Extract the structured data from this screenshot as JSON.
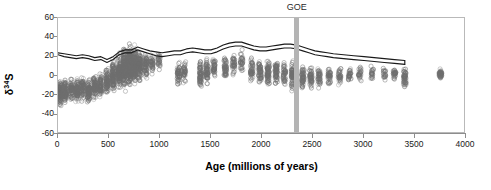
{
  "chart_data": {
    "type": "scatter",
    "title": "",
    "xlabel": "Age (millions of years)",
    "ylabel_text": "δ",
    "ylabel_sup": "34",
    "ylabel_tail": "S",
    "xlim": [
      0,
      4000
    ],
    "ylim": [
      -60,
      60
    ],
    "xticks": [
      0,
      500,
      1000,
      1500,
      2000,
      2500,
      3000,
      3500,
      4000
    ],
    "yticks": [
      60,
      40,
      20,
      0,
      -20,
      -40,
      -60
    ],
    "grid": false,
    "legend": "none",
    "annotations": [
      {
        "label": "GOE",
        "x": 2350,
        "type": "vertical-band",
        "color": "#b4b4b4",
        "width_myr": 50
      }
    ],
    "marker": {
      "shape": "open-circle",
      "color": "#6e6e6e",
      "size": 2.1
    },
    "series": [
      {
        "name": "sulfate δ34S trend upper",
        "type": "line",
        "color": "#1a1a1a",
        "x": [
          0,
          60,
          120,
          180,
          240,
          300,
          360,
          420,
          480,
          540,
          600,
          660,
          720,
          780,
          840,
          900,
          960,
          1020,
          1080,
          1140,
          1200,
          1260,
          1320,
          1380,
          1440,
          1500,
          1560,
          1620,
          1680,
          1740,
          1800,
          1860,
          1920,
          1980,
          2040,
          2100,
          2160,
          2220,
          2280,
          2340,
          2400,
          2460,
          2520,
          2580,
          2640,
          2700,
          2800,
          2900,
          3000,
          3100,
          3200,
          3300,
          3400
        ],
        "y": [
          24,
          23,
          22,
          21,
          22,
          21,
          19,
          20,
          17,
          20,
          25,
          27,
          27,
          30,
          28,
          26,
          25,
          24,
          25,
          26,
          26,
          28,
          29,
          28,
          27,
          27,
          29,
          32,
          34,
          35,
          35,
          33,
          31,
          30,
          30,
          31,
          32,
          33,
          33,
          32,
          30,
          28,
          26,
          25,
          24,
          23,
          22,
          21,
          20,
          19,
          18,
          17,
          16
        ]
      },
      {
        "name": "sulfate δ34S trend lower",
        "type": "line",
        "color": "#1a1a1a",
        "x": [
          0,
          60,
          120,
          180,
          240,
          300,
          360,
          420,
          480,
          540,
          600,
          660,
          720,
          780,
          840,
          900,
          960,
          1020,
          1080,
          1140,
          1200,
          1260,
          1320,
          1380,
          1440,
          1500,
          1560,
          1620,
          1680,
          1740,
          1800,
          1860,
          1920,
          1980,
          2040,
          2100,
          2160,
          2220,
          2280,
          2340,
          2400,
          2460,
          2520,
          2580,
          2640,
          2700,
          2800,
          2900,
          3000,
          3100,
          3200,
          3300,
          3400
        ],
        "y": [
          22,
          20,
          19,
          18,
          19,
          18,
          16,
          17,
          14,
          17,
          22,
          24,
          24,
          27,
          25,
          23,
          21,
          20,
          21,
          22,
          22,
          24,
          25,
          24,
          23,
          23,
          25,
          28,
          30,
          31,
          31,
          29,
          27,
          26,
          26,
          27,
          28,
          29,
          29,
          28,
          26,
          24,
          22,
          21,
          20,
          19,
          18,
          17,
          16,
          15,
          14,
          13,
          12
        ]
      }
    ],
    "scatter_clusters": [
      {
        "x": 20,
        "n": 120,
        "ymin": -55,
        "ymax": 25,
        "ycenter": -18,
        "spread": 14
      },
      {
        "x": 70,
        "n": 90,
        "ymin": -50,
        "ymax": 22,
        "ycenter": -16,
        "spread": 13
      },
      {
        "x": 130,
        "n": 70,
        "ymin": -45,
        "ymax": 20,
        "ycenter": -14,
        "spread": 13
      },
      {
        "x": 185,
        "n": 85,
        "ymin": -48,
        "ymax": 22,
        "ycenter": -15,
        "spread": 14
      },
      {
        "x": 240,
        "n": 70,
        "ymin": -42,
        "ymax": 20,
        "ycenter": -12,
        "spread": 13
      },
      {
        "x": 300,
        "n": 95,
        "ymin": -50,
        "ymax": 25,
        "ycenter": -16,
        "spread": 14
      },
      {
        "x": 360,
        "n": 80,
        "ymin": -46,
        "ymax": 30,
        "ycenter": -12,
        "spread": 15
      },
      {
        "x": 420,
        "n": 75,
        "ymin": -44,
        "ymax": 28,
        "ycenter": -10,
        "spread": 15
      },
      {
        "x": 480,
        "n": 90,
        "ymin": -42,
        "ymax": 35,
        "ycenter": -6,
        "spread": 16
      },
      {
        "x": 540,
        "n": 110,
        "ymin": -40,
        "ymax": 45,
        "ycenter": 0,
        "spread": 18
      },
      {
        "x": 600,
        "n": 140,
        "ymin": -38,
        "ymax": 52,
        "ycenter": 5,
        "spread": 20
      },
      {
        "x": 650,
        "n": 170,
        "ymin": -40,
        "ymax": 58,
        "ycenter": 8,
        "spread": 22
      },
      {
        "x": 700,
        "n": 210,
        "ymin": -42,
        "ymax": 60,
        "ycenter": 10,
        "spread": 24
      },
      {
        "x": 750,
        "n": 160,
        "ymin": -35,
        "ymax": 55,
        "ycenter": 12,
        "spread": 21
      },
      {
        "x": 800,
        "n": 110,
        "ymin": -30,
        "ymax": 45,
        "ycenter": 10,
        "spread": 19
      },
      {
        "x": 860,
        "n": 70,
        "ymin": -25,
        "ymax": 40,
        "ycenter": 12,
        "spread": 16
      },
      {
        "x": 920,
        "n": 45,
        "ymin": -20,
        "ymax": 35,
        "ycenter": 14,
        "spread": 14
      },
      {
        "x": 990,
        "n": 30,
        "ymin": -15,
        "ymax": 32,
        "ycenter": 16,
        "spread": 12
      },
      {
        "x": 1180,
        "n": 55,
        "ymin": -25,
        "ymax": 32,
        "ycenter": 2,
        "spread": 15
      },
      {
        "x": 1240,
        "n": 40,
        "ymin": -22,
        "ymax": 30,
        "ycenter": 4,
        "spread": 14
      },
      {
        "x": 1400,
        "n": 70,
        "ymin": -28,
        "ymax": 35,
        "ycenter": 3,
        "spread": 16
      },
      {
        "x": 1460,
        "n": 60,
        "ymin": -26,
        "ymax": 33,
        "ycenter": 5,
        "spread": 15
      },
      {
        "x": 1530,
        "n": 45,
        "ymin": -20,
        "ymax": 32,
        "ycenter": 8,
        "spread": 14
      },
      {
        "x": 1640,
        "n": 50,
        "ymin": -22,
        "ymax": 38,
        "ycenter": 8,
        "spread": 15
      },
      {
        "x": 1720,
        "n": 40,
        "ymin": -18,
        "ymax": 40,
        "ycenter": 12,
        "spread": 14
      },
      {
        "x": 1800,
        "n": 35,
        "ymin": -15,
        "ymax": 38,
        "ycenter": 14,
        "spread": 13
      },
      {
        "x": 1900,
        "n": 55,
        "ymin": -25,
        "ymax": 35,
        "ycenter": 6,
        "spread": 15
      },
      {
        "x": 1980,
        "n": 60,
        "ymin": -28,
        "ymax": 34,
        "ycenter": 4,
        "spread": 16
      },
      {
        "x": 2060,
        "n": 75,
        "ymin": -30,
        "ymax": 36,
        "ycenter": 3,
        "spread": 17
      },
      {
        "x": 2140,
        "n": 65,
        "ymin": -28,
        "ymax": 35,
        "ycenter": 4,
        "spread": 16
      },
      {
        "x": 2220,
        "n": 50,
        "ymin": -26,
        "ymax": 32,
        "ycenter": 3,
        "spread": 15
      },
      {
        "x": 2300,
        "n": 70,
        "ymin": -30,
        "ymax": 33,
        "ycenter": 0,
        "spread": 16
      },
      {
        "x": 2400,
        "n": 60,
        "ymin": -28,
        "ymax": 30,
        "ycenter": -2,
        "spread": 15
      },
      {
        "x": 2480,
        "n": 55,
        "ymin": -26,
        "ymax": 28,
        "ycenter": -2,
        "spread": 14
      },
      {
        "x": 2560,
        "n": 45,
        "ymin": -24,
        "ymax": 26,
        "ycenter": -1,
        "spread": 13
      },
      {
        "x": 2660,
        "n": 40,
        "ymin": -22,
        "ymax": 24,
        "ycenter": 0,
        "spread": 12
      },
      {
        "x": 2760,
        "n": 35,
        "ymin": -20,
        "ymax": 22,
        "ycenter": 0,
        "spread": 11
      },
      {
        "x": 2860,
        "n": 30,
        "ymin": -18,
        "ymax": 20,
        "ycenter": 1,
        "spread": 10
      },
      {
        "x": 2960,
        "n": 28,
        "ymin": -16,
        "ymax": 20,
        "ycenter": 2,
        "spread": 10
      },
      {
        "x": 3080,
        "n": 25,
        "ymin": -14,
        "ymax": 18,
        "ycenter": 2,
        "spread": 9
      },
      {
        "x": 3200,
        "n": 22,
        "ymin": -12,
        "ymax": 16,
        "ycenter": 2,
        "spread": 8
      },
      {
        "x": 3300,
        "n": 30,
        "ymin": -14,
        "ymax": 18,
        "ycenter": 2,
        "spread": 9
      },
      {
        "x": 3400,
        "n": 55,
        "ymin": -22,
        "ymax": 18,
        "ycenter": -2,
        "spread": 11
      },
      {
        "x": 3750,
        "n": 45,
        "ymin": -8,
        "ymax": 12,
        "ycenter": 2,
        "spread": 5
      }
    ]
  },
  "axis": {
    "ylabel_full": "δ34S",
    "xlabel": "Age (millions of years)",
    "xticklabels": [
      "0",
      "500",
      "1000",
      "1500",
      "2000",
      "2500",
      "3000",
      "3500",
      "4000"
    ],
    "yticklabels": [
      "60",
      "40",
      "20",
      "0",
      "-20",
      "-40",
      "-60"
    ]
  },
  "annotation": {
    "goe_label": "GOE"
  }
}
